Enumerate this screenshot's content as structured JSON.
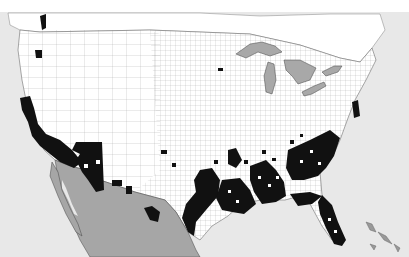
{
  "map": {
    "type": "county choropleth",
    "region": "Contiguous United States with southern Canada and northern Mexico",
    "colors": {
      "ocean": "#e8e8e8",
      "land": "#ffffff",
      "highlighted_county": "#111111",
      "mexico": "#a6a6a6",
      "great_lakes": "#a8a8a8",
      "borders": "#555555"
    },
    "highlighted_regions": [
      "Southern California",
      "Arizona",
      "Southern New Mexico / West Texas border",
      "Texas Gulf Coast",
      "Louisiana",
      "Mississippi",
      "Alabama",
      "Georgia",
      "South Carolina",
      "Florida",
      "Scattered counties in Oklahoma, Arkansas, Kansas",
      "Washington Puget Sound",
      "Oregon (Portland area)",
      "Scattered counties in Virginia / Maryland coast"
    ],
    "legend": null,
    "labels": []
  }
}
